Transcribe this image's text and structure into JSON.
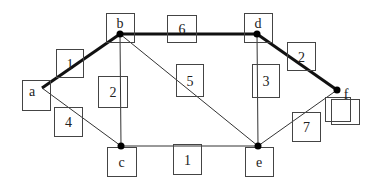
{
  "diagram": {
    "type": "weighted-graph",
    "highlighted_path": [
      "a",
      "b",
      "d",
      "f"
    ],
    "nodes": [
      {
        "id": "a",
        "label": "a",
        "x": 42,
        "y": 88,
        "box": [
          22,
          80,
          28,
          30
        ]
      },
      {
        "id": "b",
        "label": "b",
        "x": 120,
        "y": 34,
        "box": [
          106,
          13,
          28,
          29
        ]
      },
      {
        "id": "c",
        "label": "c",
        "x": 121,
        "y": 146,
        "box": [
          107,
          147,
          29,
          29
        ]
      },
      {
        "id": "d",
        "label": "d",
        "x": 257,
        "y": 34,
        "box": [
          244,
          13,
          28,
          29
        ]
      },
      {
        "id": "e",
        "label": "e",
        "x": 258,
        "y": 146,
        "box": [
          245,
          147,
          28,
          29
        ]
      },
      {
        "id": "f",
        "label": "f",
        "x": 337,
        "y": 90,
        "box": [
          325,
          97,
          25,
          24
        ],
        "box2": [
          331,
          99,
          28,
          25
        ]
      }
    ],
    "edges": [
      {
        "from": "a",
        "to": "b",
        "weight": "1",
        "bold": true,
        "label_box": [
          56,
          49,
          27,
          28
        ]
      },
      {
        "from": "a",
        "to": "c",
        "weight": "4",
        "bold": false,
        "label_box": [
          54,
          107,
          28,
          29
        ]
      },
      {
        "from": "b",
        "to": "c",
        "weight": "2",
        "bold": false,
        "label_box": [
          98,
          76,
          29,
          31
        ]
      },
      {
        "from": "b",
        "to": "d",
        "weight": "6",
        "bold": true,
        "label_box": [
          167,
          15,
          29,
          27
        ]
      },
      {
        "from": "b",
        "to": "e",
        "weight": "5",
        "bold": false,
        "label_box": [
          176,
          64,
          27,
          32
        ]
      },
      {
        "from": "d",
        "to": "e",
        "weight": "3",
        "bold": false,
        "label_box": [
          252,
          64,
          27,
          33
        ]
      },
      {
        "from": "d",
        "to": "f",
        "weight": "2",
        "bold": true,
        "label_box": [
          287,
          42,
          28,
          28
        ]
      },
      {
        "from": "c",
        "to": "e",
        "weight": "1",
        "bold": false,
        "label_box": [
          173,
          144,
          28,
          30
        ]
      },
      {
        "from": "e",
        "to": "f",
        "weight": "7",
        "bold": false,
        "label_box": [
          292,
          112,
          28,
          29
        ]
      }
    ]
  }
}
